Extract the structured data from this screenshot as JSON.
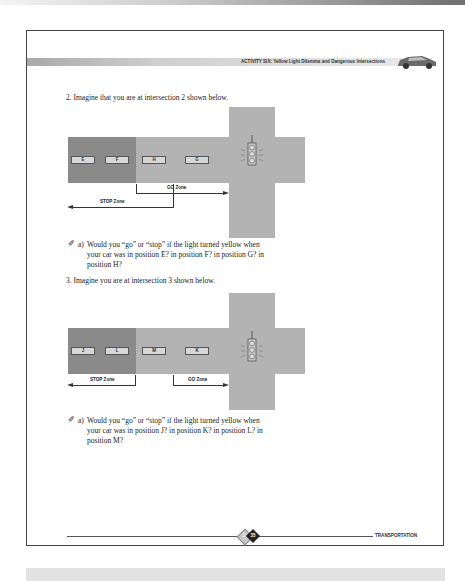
{
  "header": {
    "title": "ACTIVITY SIX: Yellow Light Dilemma and Dangerous Intersections",
    "icon": "car-icon"
  },
  "question2": {
    "prompt": "2. Imagine that you are at intersection 2 shown below.",
    "diagram": {
      "cars": [
        "E",
        "F",
        "H",
        "G"
      ],
      "go_zone_label": "GO Zone",
      "stop_zone_label": "STOP Zone",
      "icon": "traffic-light-icon"
    },
    "part_a_label": "a)",
    "part_a_line1": "Would you “go” or “stop” if the light turned yellow when",
    "part_a_line2": "your car was in position E? in position F? in position G? in",
    "part_a_line3": "position H?"
  },
  "question3": {
    "prompt": "3. Imagine you are at intersection 3 shown below.",
    "diagram": {
      "cars": [
        "J",
        "L",
        "M",
        "K"
      ],
      "go_zone_label": "GO Zone",
      "stop_zone_label": "STOP Zone",
      "icon": "traffic-light-icon"
    },
    "part_a_label": "a)",
    "part_a_line1": "Would you “go” or “stop” if the light turned yellow when",
    "part_a_line2": "your car was in position J? in position K? in position L? in",
    "part_a_line3": "position M?"
  },
  "footer": {
    "page_prefix": "1",
    "page_number": "35",
    "section": "TRANSPORTATION"
  },
  "colors": {
    "road": "#b3b3b3",
    "stop_area": "#8a8a8a",
    "border": "#444444"
  }
}
